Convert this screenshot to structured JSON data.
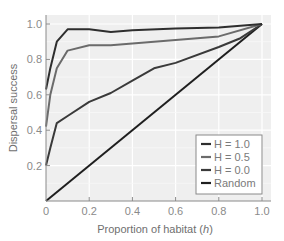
{
  "chart_data": {
    "type": "line",
    "title": "",
    "xlabel": "Proportion of habitat (h)",
    "xlabel_main": "Proportion of habitat (",
    "xlabel_var": "h",
    "xlabel_end": ")",
    "ylabel": "Dispersal success",
    "xlim": [
      0,
      1.0
    ],
    "ylim": [
      0,
      1.05
    ],
    "x_ticks": [
      "0",
      "0.2",
      "0.4",
      "0.6",
      "0.8",
      "1.0"
    ],
    "y_ticks": [
      "0.2",
      "0.4",
      "0.6",
      "0.8",
      "1.0"
    ],
    "grid": true,
    "legend_position": "lower right",
    "series": [
      {
        "name": "H = 1.0",
        "color": "#2e2e2e",
        "x": [
          0,
          0.02,
          0.05,
          0.1,
          0.2,
          0.3,
          0.4,
          0.6,
          0.8,
          1.0
        ],
        "y": [
          0.63,
          0.75,
          0.9,
          0.97,
          0.97,
          0.955,
          0.965,
          0.975,
          0.98,
          1.0
        ]
      },
      {
        "name": "H = 0.5",
        "color": "#6b6b6b",
        "x": [
          0,
          0.02,
          0.05,
          0.1,
          0.2,
          0.3,
          0.4,
          0.6,
          0.8,
          1.0
        ],
        "y": [
          0.42,
          0.6,
          0.75,
          0.85,
          0.88,
          0.88,
          0.89,
          0.91,
          0.93,
          1.0
        ]
      },
      {
        "name": "H = 0.0",
        "color": "#3a3a3a",
        "x": [
          0,
          0.02,
          0.05,
          0.1,
          0.2,
          0.3,
          0.4,
          0.5,
          0.6,
          0.8,
          0.9,
          1.0
        ],
        "y": [
          0.2,
          0.3,
          0.44,
          0.48,
          0.56,
          0.61,
          0.68,
          0.75,
          0.78,
          0.87,
          0.92,
          1.0
        ]
      },
      {
        "name": "Random",
        "color": "#1f1f1f",
        "x": [
          0,
          1.0
        ],
        "y": [
          0,
          1.0
        ]
      }
    ]
  }
}
